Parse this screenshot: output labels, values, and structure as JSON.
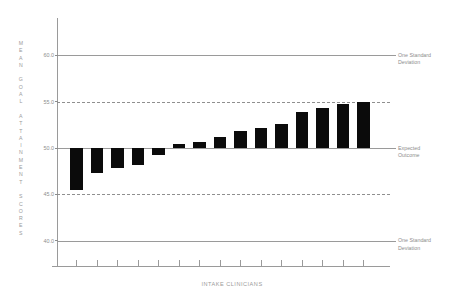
{
  "chart_data": {
    "type": "bar",
    "title": "",
    "subtitle": "",
    "xlabel": "INTAKE CLINICIANS",
    "ylabel": "MEAN GOAL ATTAINMENT SCORES",
    "categories": [
      "1",
      "2",
      "3",
      "4",
      "5",
      "6",
      "7",
      "8",
      "9",
      "10",
      "11",
      "12",
      "13",
      "14",
      "15"
    ],
    "values": [
      45.5,
      47.3,
      47.8,
      48.2,
      49.3,
      50.4,
      50.7,
      51.2,
      51.8,
      52.2,
      52.6,
      53.9,
      54.3,
      54.7,
      55.0
    ],
    "baseline": 50.0,
    "ylim": [
      37.3,
      64.0
    ],
    "yticks": [
      60.0,
      55.0,
      50.0,
      45.0,
      40.0
    ],
    "ytick_labels": [
      "60.0",
      "55.0",
      "50.0",
      "45.0",
      "40.0"
    ],
    "gridline_styles": [
      "solid",
      "dashed",
      "solid",
      "dashed",
      "solid"
    ],
    "grid": true,
    "legend": "none",
    "bar_color": "#0b0b0b",
    "axis_color": "#9a9a9a",
    "text_color": "#8d8d8d",
    "annotations": [
      {
        "at_value": 60.0,
        "line1": "One  Standard",
        "line2": "Deviation"
      },
      {
        "at_value": 50.0,
        "line1": "Expected",
        "line2": "Outcome"
      },
      {
        "at_value": 40.0,
        "line1": "One  Standard",
        "line2": "Deviation"
      }
    ],
    "xtick_count": 15,
    "xtick_labels": [
      "",
      "",
      "",
      "",
      "",
      "",
      "",
      "",
      "",
      "",
      "",
      "",
      "",
      "",
      ""
    ]
  },
  "axis": {
    "y_title_letters": [
      "M",
      "E",
      "A",
      "N",
      "",
      "G",
      "O",
      "A",
      "L",
      "",
      "A",
      "T",
      "T",
      "A",
      "I",
      "N",
      "M",
      "E",
      "N",
      "T",
      "",
      "S",
      "C",
      "O",
      "R",
      "E",
      "S"
    ],
    "x_title": "INTAKE CLINICIANS"
  }
}
